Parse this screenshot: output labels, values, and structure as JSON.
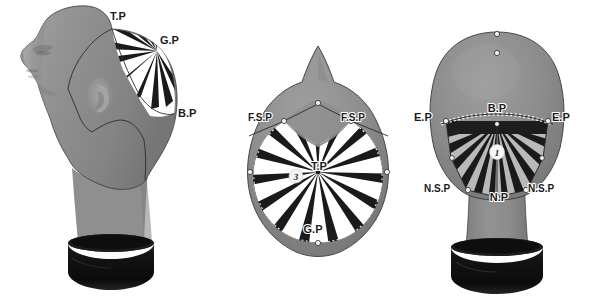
{
  "figure": {
    "type": "instructional-diagram",
    "background_color": "#ffffff",
    "views": [
      "side-profile",
      "top-view",
      "back-view"
    ]
  },
  "palette": {
    "background": "#ffffff",
    "head_gray": "#8d8d8d",
    "head_gray_light": "#9c9c9c",
    "head_gray_dark": "#6f6f6f",
    "head_shadow": "#5e5e5e",
    "stand_black": "#111111",
    "stand_black_light": "#2a2a2a",
    "stripe_dark": "#1a1a1a",
    "stripe_light": "#ffffff",
    "stripe_light_back": "#b9b9b9",
    "outline": "#2b2b2b",
    "label_color": "#1c1c1c",
    "marker_fill": "#f2f2f2",
    "marker_stroke": "#2b2b2b"
  },
  "views": {
    "side": {
      "name": "side-profile-view",
      "labels": [
        {
          "id": "tp",
          "text": "T.P",
          "x": 118,
          "y": 20,
          "anchor": "middle"
        },
        {
          "id": "gp",
          "text": "G.P",
          "x": 160,
          "y": 44,
          "anchor": "start"
        },
        {
          "id": "bp",
          "text": "B.P",
          "x": 178,
          "y": 113,
          "anchor": "start"
        }
      ],
      "markers": [
        {
          "id": "tp-point",
          "x": 112,
          "y": 29
        },
        {
          "id": "gp-point",
          "x": 157,
          "y": 51
        },
        {
          "id": "bp-point",
          "x": 174,
          "y": 113
        },
        {
          "id": "sec-1",
          "x": 58,
          "y": 54
        },
        {
          "id": "sec-2",
          "x": 68,
          "y": 60
        },
        {
          "id": "sec-3",
          "x": 76,
          "y": 99
        },
        {
          "id": "sec-4",
          "x": 90,
          "y": 129
        },
        {
          "id": "sec-5",
          "x": 118,
          "y": 119
        },
        {
          "id": "sec-6",
          "x": 143,
          "y": 147
        },
        {
          "id": "sec-7",
          "x": 140,
          "y": 184
        },
        {
          "id": "sec-8",
          "x": 153,
          "y": 185
        },
        {
          "id": "sec-9",
          "x": 96,
          "y": 45
        }
      ],
      "stripe_count": 9
    },
    "top": {
      "name": "top-view",
      "labels": [
        {
          "id": "fsp-left",
          "text": "F.S.P",
          "x": 250,
          "y": 118,
          "anchor": "start"
        },
        {
          "id": "fsp-right",
          "text": "F.S.P",
          "x": 343,
          "y": 118,
          "anchor": "start"
        },
        {
          "id": "tp-center",
          "text": "T.P",
          "x": 318,
          "y": 162,
          "anchor": "middle"
        },
        {
          "id": "gp-bottom",
          "text": "G.P",
          "x": 313,
          "y": 230,
          "anchor": "middle"
        }
      ],
      "markers": [
        {
          "id": "crown",
          "x": 318,
          "y": 96
        },
        {
          "id": "fsp-l-pt",
          "x": 284,
          "y": 121
        },
        {
          "id": "fsp-r-pt",
          "x": 351,
          "y": 121
        },
        {
          "id": "side-l-pt",
          "x": 251,
          "y": 170
        },
        {
          "id": "side-r-pt",
          "x": 383,
          "y": 170
        },
        {
          "id": "gp-pt",
          "x": 318,
          "y": 240
        }
      ],
      "badge": {
        "id": "badge-3",
        "text": "3",
        "x": 296,
        "y": 176
      },
      "stripe_count": 24
    },
    "back": {
      "name": "back-view",
      "labels": [
        {
          "id": "ep-left",
          "text": "E.P",
          "x": 418,
          "y": 117,
          "anchor": "start"
        },
        {
          "id": "bp-center",
          "text": "B.P",
          "x": 497,
          "y": 114,
          "anchor": "middle"
        },
        {
          "id": "ep-right",
          "text": "E.P",
          "x": 556,
          "y": 117,
          "anchor": "start"
        },
        {
          "id": "nsp-left",
          "text": "N.S.P",
          "x": 428,
          "y": 188,
          "anchor": "start"
        },
        {
          "id": "np-center",
          "text": "N.P",
          "x": 499,
          "y": 196,
          "anchor": "middle"
        },
        {
          "id": "nsp-right",
          "text": "N.S.P",
          "x": 530,
          "y": 188,
          "anchor": "start"
        }
      ],
      "markers": [
        {
          "id": "crown-top",
          "x": 497,
          "y": 35
        },
        {
          "id": "crown-mid",
          "x": 497,
          "y": 53
        },
        {
          "id": "bp-point",
          "x": 497,
          "y": 124
        },
        {
          "id": "ep-l-point",
          "x": 446,
          "y": 121
        },
        {
          "id": "ep-r-point",
          "x": 548,
          "y": 121
        },
        {
          "id": "nsp-l-pt",
          "x": 469,
          "y": 189
        },
        {
          "id": "nsp-r-pt",
          "x": 525,
          "y": 189
        },
        {
          "id": "np-pt",
          "x": 497,
          "y": 196
        },
        {
          "id": "jaw-l-pt",
          "x": 453,
          "y": 156
        },
        {
          "id": "jaw-r-pt",
          "x": 541,
          "y": 156
        }
      ],
      "badge": {
        "id": "badge-1",
        "text": "1",
        "x": 497,
        "y": 152
      },
      "stripe_count": 18
    }
  }
}
